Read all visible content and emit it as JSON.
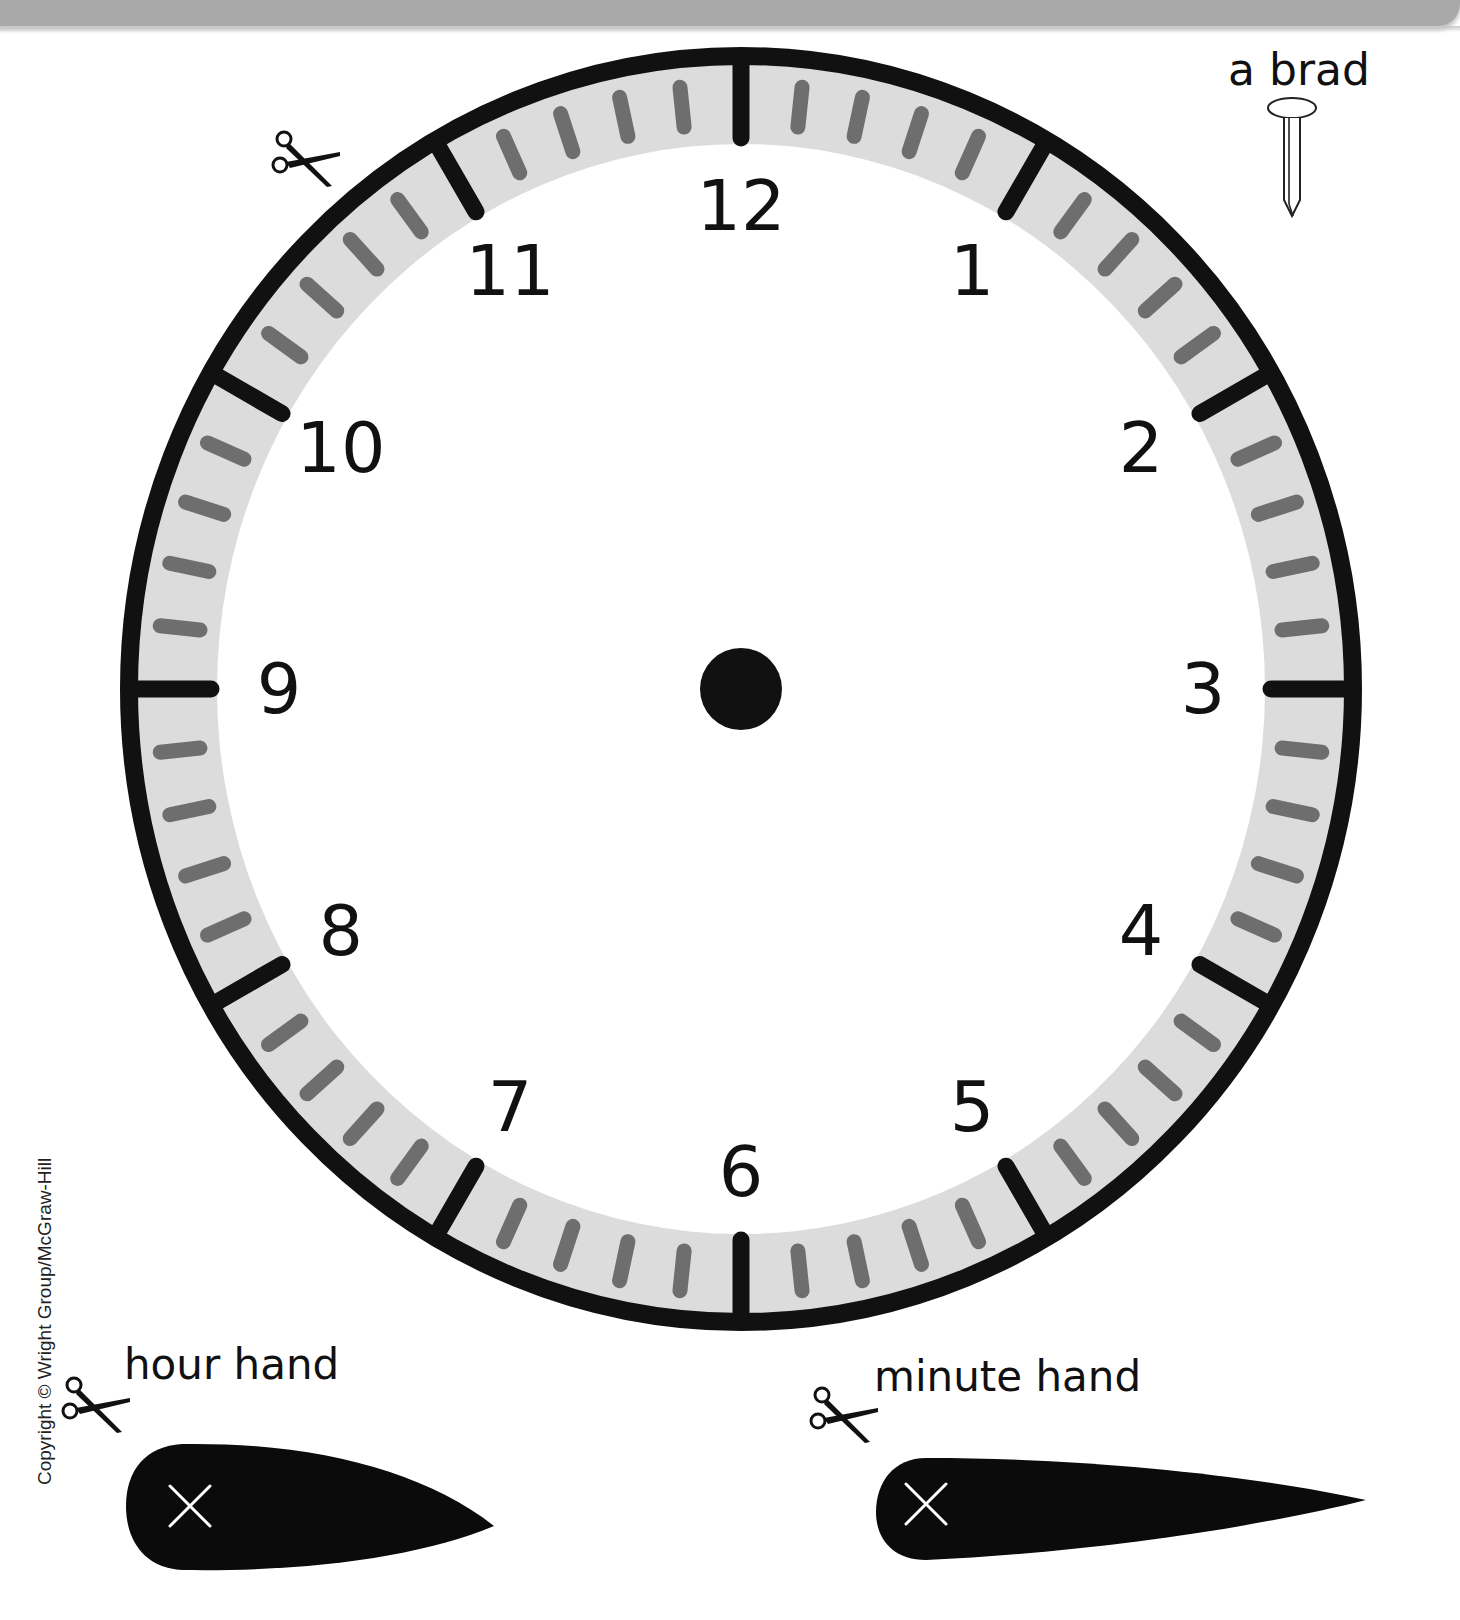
{
  "page": {
    "header_band_color": "#a9a9a9"
  },
  "clock": {
    "center": {
      "x": 741,
      "y": 689
    },
    "radius_x": 612,
    "radius_y": 633,
    "numbers": [
      "12",
      "1",
      "2",
      "3",
      "4",
      "5",
      "6",
      "7",
      "8",
      "9",
      "10",
      "11"
    ],
    "ring_color": "#111111",
    "band_color": "#dcdcdc",
    "minute_tick_color": "#6e6e6e",
    "hour_tick_color": "#111111",
    "center_dot_label": "center hole"
  },
  "brad": {
    "label": "a brad",
    "icon": "brad-icon"
  },
  "hour_hand": {
    "label": "hour hand",
    "icon": "scissors-icon",
    "mark": "X"
  },
  "minute_hand": {
    "label": "minute hand",
    "icon": "scissors-icon",
    "mark": "X"
  },
  "clock_scissors": {
    "icon": "scissors-icon"
  },
  "copyright": "Copyright © Wright Group/McGraw-Hill"
}
